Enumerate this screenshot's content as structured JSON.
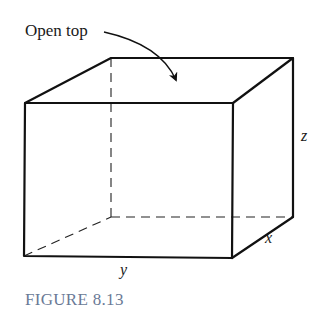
{
  "figure": {
    "caption": "FIGURE 8.13",
    "caption_color": "#6a7a96",
    "line_color": "#111111",
    "annotation": "Open top",
    "labels": {
      "width": "y",
      "depth": "x",
      "height": "z"
    },
    "box": {
      "front_top_left": [
        25,
        103
      ],
      "front_top_right": [
        233,
        103
      ],
      "front_bottom_left": [
        24,
        256
      ],
      "front_bottom_right": [
        232,
        258
      ],
      "back_top_left": [
        111,
        58
      ],
      "back_top_right": [
        293,
        58
      ],
      "back_bottom_left": [
        111,
        217
      ],
      "back_bottom_right": [
        293,
        217
      ],
      "hidden_edges_dashed": true
    }
  }
}
